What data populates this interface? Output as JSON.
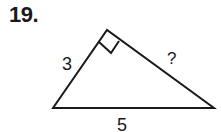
{
  "problem": {
    "number": "19."
  },
  "triangle": {
    "type": "right triangle",
    "vertices": {
      "left": [
        53,
        108
      ],
      "top": [
        107,
        30
      ],
      "right": [
        214,
        108
      ]
    },
    "right_angle_at": "top",
    "sides": {
      "left_leg": "3",
      "right_leg": "?",
      "hypotenuse": "5"
    },
    "stroke_color": "#1a1a1a"
  }
}
